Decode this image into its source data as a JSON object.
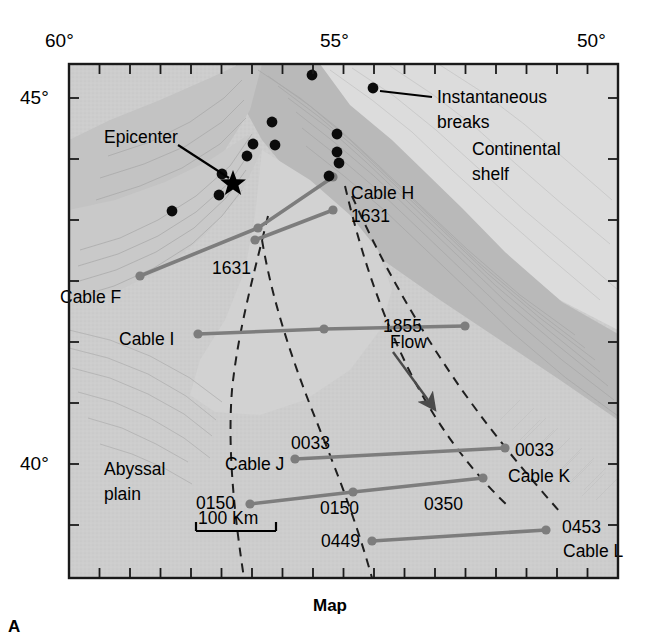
{
  "figure": {
    "caption": "Map",
    "panel_letter": "A",
    "frame": {
      "left": 69,
      "top": 64,
      "right": 618,
      "bottom": 578
    }
  },
  "axes": {
    "top": {
      "labels": [
        {
          "text": "60°",
          "x": 69
        },
        {
          "text": "55°",
          "x": 344
        },
        {
          "text": "50°",
          "x": 600
        }
      ],
      "tick_spacing_px": 30.5,
      "tick_count": 19
    },
    "left": {
      "labels": [
        {
          "text": "45°",
          "y": 98
        },
        {
          "text": "40°",
          "y": 464
        }
      ],
      "tick_spacing_px": 61,
      "tick_count": 9
    }
  },
  "annotations": {
    "epicenter": "Epicenter",
    "instantaneous_breaks": "Instantaneous\nbreaks",
    "instantaneous_breaks_line1": "Instantaneous",
    "instantaneous_breaks_line2": "breaks",
    "continental_shelf_line1": "Continental",
    "continental_shelf_line2": "shelf",
    "abyssal_plain_line1": "Abyssal",
    "abyssal_plain_line2": "plain",
    "flow": "Flow",
    "scale_bar": "100 Km"
  },
  "cables": [
    {
      "name": "Cable F",
      "label_x": 60,
      "label_y": 297,
      "break_times": [
        {
          "text": "1631",
          "x": 212,
          "y": 268
        }
      ],
      "points": [
        [
          140,
          276
        ],
        [
          258,
          228
        ],
        [
          333,
          177
        ]
      ]
    },
    {
      "name": "Cable H",
      "label_x": 351,
      "label_y": 193,
      "break_times": [
        {
          "text": "1631",
          "x": 351,
          "y": 216
        }
      ],
      "points": [
        [
          255,
          240
        ],
        [
          333,
          210
        ]
      ]
    },
    {
      "name": "Cable I",
      "label_x": 119,
      "label_y": 339,
      "break_times": [
        {
          "text": "1855",
          "x": 383,
          "y": 326
        }
      ],
      "points": [
        [
          198,
          334
        ],
        [
          324,
          329
        ],
        [
          465,
          326
        ]
      ]
    },
    {
      "name": "Cable J",
      "label_x": 225,
      "label_y": 464,
      "break_times": [
        {
          "text": "0033",
          "x": 291,
          "y": 443
        },
        {
          "text": "0150",
          "x": 196,
          "y": 503
        }
      ],
      "points": [
        [
          295,
          459
        ],
        [
          505,
          448
        ]
      ]
    },
    {
      "name": "Cable K",
      "label_x": 508,
      "label_y": 476,
      "break_times": [
        {
          "text": "0033",
          "x": 515,
          "y": 450
        },
        {
          "text": "0350",
          "x": 424,
          "y": 504
        },
        {
          "text": "0150",
          "x": 320,
          "y": 508
        }
      ],
      "points": [
        [
          250,
          504
        ],
        [
          353,
          492
        ],
        [
          483,
          478
        ]
      ]
    },
    {
      "name": "Cable L",
      "label_x": 563,
      "label_y": 551,
      "break_times": [
        {
          "text": "0449",
          "x": 321,
          "y": 541
        },
        {
          "text": "0453",
          "x": 562,
          "y": 527
        }
      ],
      "points": [
        [
          372,
          541
        ],
        [
          546,
          530
        ]
      ]
    }
  ],
  "instantaneous_break_dots": [
    [
      312,
      75
    ],
    [
      373,
      88
    ],
    [
      272,
      122
    ],
    [
      275,
      145
    ],
    [
      253,
      144
    ],
    [
      337,
      134
    ],
    [
      337,
      152
    ],
    [
      339,
      162
    ],
    [
      247,
      156
    ],
    [
      222,
      174
    ],
    [
      219,
      195
    ],
    [
      172,
      211
    ],
    [
      329,
      176
    ]
  ],
  "epicenter_marker": {
    "x": 233,
    "y": 181
  },
  "epicenter_leader": {
    "from_x": 213,
    "from_y": 152,
    "to_x": 229,
    "to_y": 178
  },
  "breaks_leader": {
    "from_x": 380,
    "from_y": 91,
    "to_x": 430,
    "to_y": 97
  },
  "flow_arrow": {
    "from_x": 395,
    "from_y": 355,
    "to_x": 430,
    "to_y": 404
  },
  "scale_bar_geometry": {
    "x1": 196,
    "x2": 276,
    "y": 531
  },
  "colors": {
    "cable_line": "#808080",
    "shelf": "#d8d8d8",
    "slope": "#b4b4b4",
    "plain": "#cccccc",
    "frame": "#1a1a1a",
    "text": "#000000"
  }
}
